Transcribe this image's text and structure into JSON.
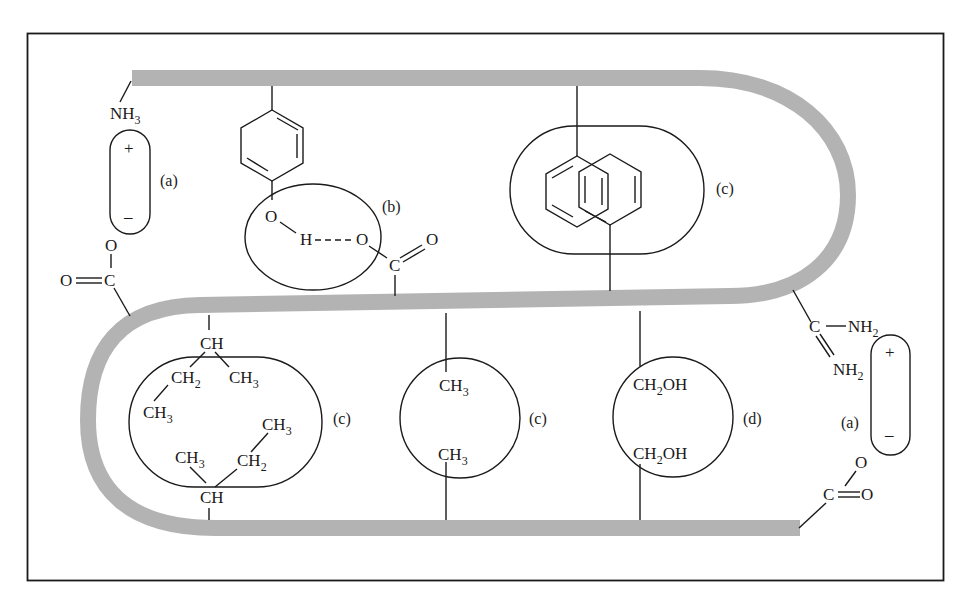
{
  "figure": {
    "colors": {
      "backbone": "#b3b3b3",
      "ink": "#1a1a1a",
      "background": "#ffffff"
    }
  },
  "interactions": {
    "ionic_top_left": {
      "label": "(a)",
      "cation_group": "NH",
      "cation_sub": "3",
      "plus": "+",
      "minus": "–",
      "anion_o": "O",
      "anion_c": "C",
      "anion_dbl_o": "O"
    },
    "hbond": {
      "label": "(b)",
      "phenol_o": "O",
      "h": "H",
      "acceptor_o": "O",
      "carboxyl_c": "C",
      "carboxyl_o": "O"
    },
    "aromatic_stack": {
      "label": "(c)"
    },
    "ionic_right": {
      "label": "(a)",
      "c": "C",
      "nh2_top": "NH",
      "nh2_top_sub": "2",
      "nh2_bottom": "NH",
      "nh2_bottom_sub": "2",
      "plus": "+",
      "minus": "–",
      "anion_o": "O",
      "anion_c": "C",
      "anion_dbl_o": "O"
    },
    "isoleucine_pair": {
      "label": "(c)",
      "top_ch": "CH",
      "top_ch2": "CH",
      "top_ch2_sub": "2",
      "top_ch3_right": "CH",
      "top_ch3_right_sub": "3",
      "top_ch3_left": "CH",
      "top_ch3_left_sub": "3",
      "bottom_ch3_right": "CH",
      "bottom_ch3_right_sub": "3",
      "bottom_ch3_left": "CH",
      "bottom_ch3_left_sub": "3",
      "bottom_ch2": "CH",
      "bottom_ch2_sub": "2",
      "bottom_ch": "CH"
    },
    "alanine_pair": {
      "label": "(c)",
      "top": "CH",
      "top_sub": "3",
      "bottom": "CH",
      "bottom_sub": "3"
    },
    "serine_pair": {
      "label": "(d)",
      "top": "CH",
      "top_sub": "2",
      "top_tail": "OH",
      "bottom": "CH",
      "bottom_sub": "2",
      "bottom_tail": "OH"
    }
  }
}
